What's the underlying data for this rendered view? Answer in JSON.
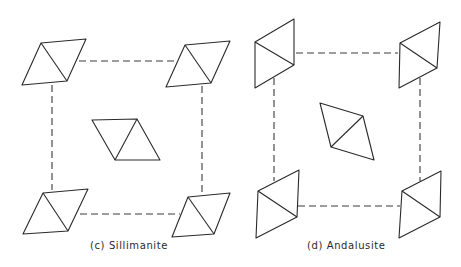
{
  "figures": [
    {
      "id": "c",
      "caption": "(c) Sillimanite",
      "caption_pos": {
        "x": 90,
        "y": 240
      },
      "links": [
        {
          "x1": 79,
          "y1": 61,
          "x2": 175,
          "y2": 61
        },
        {
          "x1": 80,
          "y1": 214,
          "x2": 180,
          "y2": 214
        },
        {
          "x1": 52,
          "y1": 85,
          "x2": 52,
          "y2": 190
        },
        {
          "x1": 202,
          "y1": 86,
          "x2": 202,
          "y2": 195
        }
      ],
      "rhombi": [
        {
          "name": "top-left",
          "points": "41,43 86,39 67,81 22,85",
          "diag": [
            41,
            43,
            67,
            81
          ]
        },
        {
          "name": "top-right",
          "points": "185,45 230,41 211,83 166,87",
          "diag": [
            185,
            45,
            211,
            83
          ]
        },
        {
          "name": "center",
          "points": "92,120 137,119 160,160 115,160",
          "diag": [
            137,
            119,
            115,
            160
          ]
        },
        {
          "name": "bottom-left",
          "points": "43,193 88,189 68,231 23,234",
          "diag": [
            43,
            193,
            68,
            231
          ]
        },
        {
          "name": "bottom-right",
          "points": "188,197 230,193 214,234 172,237",
          "diag": [
            188,
            197,
            214,
            234
          ]
        }
      ]
    },
    {
      "id": "d",
      "caption": "(d) Andalusite",
      "caption_pos": {
        "x": 307,
        "y": 240
      },
      "links": [
        {
          "x1": 296,
          "y1": 53,
          "x2": 398,
          "y2": 53
        },
        {
          "x1": 298,
          "y1": 206,
          "x2": 400,
          "y2": 206
        },
        {
          "x1": 274,
          "y1": 78,
          "x2": 274,
          "y2": 181
        },
        {
          "x1": 420,
          "y1": 78,
          "x2": 420,
          "y2": 181
        }
      ],
      "rhombi": [
        {
          "name": "top-left",
          "points": "294,19 294,65 255,88 255,42",
          "diag": [
            255,
            42,
            294,
            65
          ]
        },
        {
          "name": "top-right",
          "points": "440,22 437,68 399,88 400,43",
          "diag": [
            400,
            43,
            437,
            68
          ]
        },
        {
          "name": "center",
          "points": "320,103 363,116 374,160 331,147",
          "diag": [
            363,
            116,
            331,
            147
          ]
        },
        {
          "name": "bottom-left",
          "points": "299,170 297,217 256,238 258,191",
          "diag": [
            258,
            191,
            297,
            217
          ]
        },
        {
          "name": "bottom-right",
          "points": "441,171 440,217 399,238 402,191",
          "diag": [
            402,
            191,
            440,
            217
          ]
        }
      ]
    }
  ]
}
